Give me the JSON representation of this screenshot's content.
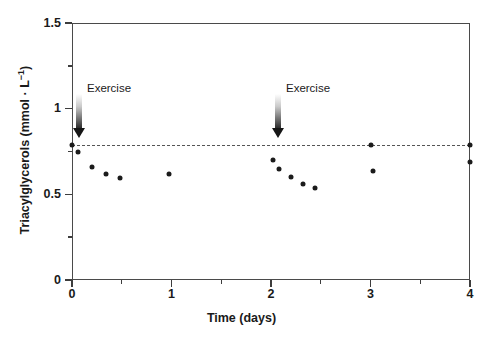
{
  "chart_data": {
    "type": "scatter",
    "title": "",
    "xlabel": "Time (days)",
    "ylabel": "Triacylglycerols (mmol · L−1)",
    "ylabel_main": "Triacylglycerols (mmol · L",
    "ylabel_sup": "−1",
    "ylabel_tail": ")",
    "xlim": [
      0,
      4
    ],
    "ylim": [
      0,
      1.5
    ],
    "grid": false,
    "legend": "none",
    "xticks": [
      0,
      1,
      2,
      3,
      4
    ],
    "xtick_labels": [
      "0",
      "1",
      "2",
      "3",
      "4"
    ],
    "x_minor_ticks": [
      0.5,
      1.5,
      2.5,
      3.5
    ],
    "yticks": [
      0,
      0.5,
      1,
      1.5
    ],
    "ytick_labels": [
      "0",
      "0.5",
      "1",
      "1.5"
    ],
    "y_minor_ticks": [
      0.25,
      0.75,
      1.25
    ],
    "marker_color": "#1b1b1b",
    "reference_line": {
      "label": "baseline",
      "y": 0.79,
      "x_start": 0,
      "x_end": 4,
      "style": "dashed",
      "color": "#555555"
    },
    "annotations": [
      {
        "label": "Exercise",
        "x": 0.05,
        "arrow_tip_y": 0.83
      },
      {
        "label": "Exercise",
        "x": 2.05,
        "arrow_tip_y": 0.83
      }
    ],
    "points": [
      {
        "x": 0.0,
        "y": 0.79
      },
      {
        "x": 0.06,
        "y": 0.745
      },
      {
        "x": 0.2,
        "y": 0.66
      },
      {
        "x": 0.34,
        "y": 0.62
      },
      {
        "x": 0.48,
        "y": 0.595
      },
      {
        "x": 0.97,
        "y": 0.62
      },
      {
        "x": 2.02,
        "y": 0.7
      },
      {
        "x": 2.08,
        "y": 0.648
      },
      {
        "x": 2.2,
        "y": 0.6
      },
      {
        "x": 2.32,
        "y": 0.56
      },
      {
        "x": 2.44,
        "y": 0.535
      },
      {
        "x": 3.0,
        "y": 0.79
      },
      {
        "x": 3.03,
        "y": 0.635
      },
      {
        "x": 4.0,
        "y": 0.79
      },
      {
        "x": 4.0,
        "y": 0.69
      }
    ]
  }
}
